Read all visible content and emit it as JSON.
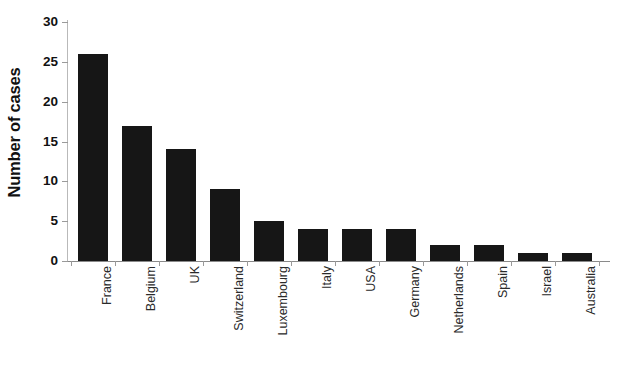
{
  "chart_data": {
    "type": "bar",
    "title": "",
    "xlabel": "",
    "ylabel": "Number of cases",
    "ylim": [
      0,
      30
    ],
    "ytick_values": [
      0,
      5,
      10,
      15,
      20,
      25,
      30
    ],
    "ytick_labels": [
      "0",
      "5",
      "10",
      "15",
      "20",
      "25",
      "30"
    ],
    "grid": false,
    "legend": null,
    "bar_color": "#161616",
    "categories": [
      "France",
      "Belgium",
      "UK",
      "Switzerland",
      "Luxembourg",
      "Italy",
      "USA",
      "Germany",
      "Netherlands",
      "Spain",
      "Israel",
      "Australia"
    ],
    "values": [
      26,
      17,
      14,
      9,
      5,
      4,
      4,
      4,
      2,
      2,
      1,
      1
    ],
    "series": [
      {
        "name": "Number of cases",
        "values": [
          26,
          17,
          14,
          9,
          5,
          4,
          4,
          4,
          2,
          2,
          1,
          1
        ]
      }
    ]
  },
  "axes": {
    "y_title": "Number of cases"
  }
}
